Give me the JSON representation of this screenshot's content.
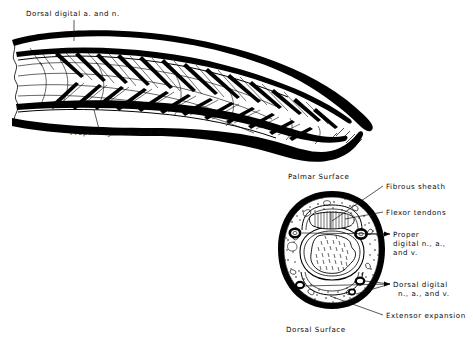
{
  "figure": {
    "kind": "anatomical-line-illustration",
    "background_color": "#ffffff",
    "ink_color": "#000000"
  },
  "panels": {
    "top": {
      "name": "longitudinal-finger-dissection",
      "labels": [
        {
          "id": "dorsal-digital",
          "text": "Dorsal  digital  a. and  n.",
          "x": 26,
          "y": 16,
          "leader": {
            "x1": 74,
            "y1": 20,
            "x2": 74,
            "y2": 41
          }
        },
        {
          "id": "proper-digital",
          "text": "Proper  digital a. and n.",
          "x": 70,
          "y": 135,
          "leader": {
            "x1": 99,
            "y1": 129,
            "x2": 94,
            "y2": 110
          }
        }
      ]
    },
    "bottom": {
      "name": "finger-cross-section",
      "labels": [
        {
          "id": "palmar-surface",
          "text": "Palmar   Surface",
          "x": 288,
          "y": 179
        },
        {
          "id": "fibrous-sheath",
          "text": "Fibrous  sheath",
          "x": 386,
          "y": 189,
          "leader": {
            "x1": 383,
            "y1": 186,
            "x2": 332,
            "y2": 221
          }
        },
        {
          "id": "flexor-tendons",
          "text": "Flexor  tendons",
          "x": 386,
          "y": 215,
          "leader": {
            "x1": 383,
            "y1": 212,
            "x2": 345,
            "y2": 219
          }
        },
        {
          "id": "proper-digital-nav-1",
          "text": "Proper",
          "x": 393,
          "y": 237
        },
        {
          "id": "proper-digital-nav-2",
          "text": "digital  n., a.,",
          "x": 393,
          "y": 246
        },
        {
          "id": "proper-digital-nav-3",
          "text": "and  v.",
          "x": 393,
          "y": 255
        },
        {
          "id": "dorsal-digital-nav-1",
          "text": "Dorsal  digital",
          "x": 393,
          "y": 287
        },
        {
          "id": "dorsal-digital-nav-2",
          "text": "n., a., and  v.",
          "x": 398,
          "y": 296
        },
        {
          "id": "extensor-expansion",
          "text": "Extensor  expansion",
          "x": 386,
          "y": 318,
          "leader": {
            "x1": 383,
            "y1": 315,
            "x2": 330,
            "y2": 297
          }
        },
        {
          "id": "dorsal-surface",
          "text": "Dorsal    Surface",
          "x": 286,
          "y": 332
        }
      ],
      "structures": [
        "skin-outer-ring",
        "subcutaneous-stippled-tissue",
        "fibrous-sheath",
        "flexor-tendons",
        "phalanx-bone-cortex",
        "phalanx-bone-marrow",
        "extensor-expansion",
        "proper-digital-neurovascular-bundle-left",
        "proper-digital-neurovascular-bundle-right",
        "dorsal-digital-neurovascular-bundle-left",
        "dorsal-digital-neurovascular-bundle-right"
      ]
    }
  }
}
